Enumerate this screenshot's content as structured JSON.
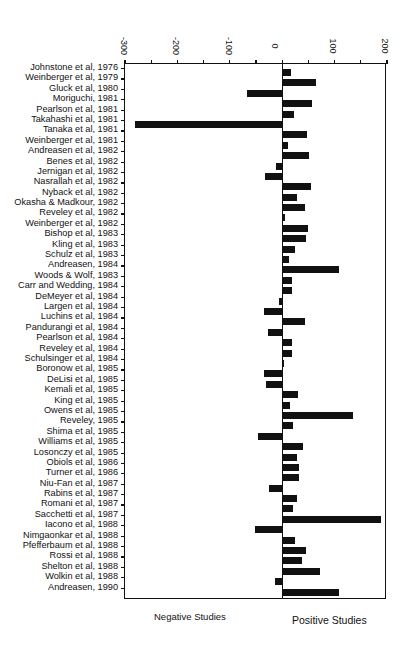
{
  "chart_data": {
    "type": "bar",
    "orientation": "horizontal",
    "title": "",
    "xlabel": "",
    "ylabel": "",
    "xlim": [
      -300,
      200
    ],
    "x_ticks": [
      -300,
      -200,
      -100,
      0,
      100,
      200
    ],
    "grid": false,
    "legend": null,
    "annotations": [
      "Negative Studies",
      "Positive Studies"
    ],
    "categories": [
      "Johnstone et al, 1976",
      "Weinberger et al, 1979",
      "Gluck et al, 1980",
      "Moriguchi, 1981",
      "Pearlson et al, 1981",
      "Takahashi et al, 1981",
      "Tanaka et al, 1981",
      "Weinberger et al, 1981",
      "Andreasen et al, 1982",
      "Benes et al, 1982",
      "Jernigan et al, 1982",
      "Nasrallah et al, 1982",
      "Nyback et al, 1982",
      "Okasha & Madkour, 1982",
      "Reveley et al, 1982",
      "Weinberger et al, 1982",
      "Bishop et al, 1983",
      "Kling et al, 1983",
      "Schulz et al, 1983",
      "Andreasen, 1984",
      "Woods & Wolf, 1983",
      "Carr and Wedding, 1984",
      "DeMeyer et al, 1984",
      "Largen et al, 1984",
      "Luchins et al, 1984",
      "Pandurangi et al, 1984",
      "Pearlson et al, 1984",
      "Reveley et al, 1984",
      "Schulsinger et al, 1984",
      "Boronow et al, 1985",
      "DeLisi et al, 1985",
      "Kemali et al, 1985",
      "King et al, 1985",
      "Owens et al, 1985",
      "Reveley, 1985",
      "Shima et al, 1985",
      "Williams et al, 1985",
      "Losonczy et al, 1985",
      "Obiols et al, 1986",
      "Turner et al, 1986",
      "Niu-Fan et al, 1987",
      "Rabins et al, 1987",
      "Romani et al, 1987",
      "Sacchetti et al, 1987",
      "Iacono et al, 1988",
      "Nimgaonkar et al, 1988",
      "Pfefferbaum et al, 1988",
      "Rossi et al, 1988",
      "Shelton et al, 1988",
      "Wolkin et al, 1988",
      "Andreasen, 1990"
    ],
    "values": [
      17,
      64,
      -68,
      57,
      22,
      -280,
      48,
      11,
      52,
      -11,
      -32,
      55,
      28,
      43,
      6,
      50,
      46,
      25,
      13,
      108,
      18,
      19,
      -7,
      -34,
      43,
      -27,
      18,
      19,
      4,
      -34,
      -31,
      30,
      15,
      136,
      20,
      -47,
      39,
      29,
      33,
      32,
      -25,
      29,
      20,
      189,
      -51,
      24,
      45,
      37,
      72,
      -14,
      109
    ]
  },
  "footer": {
    "negative_label": "Negative Studies",
    "positive_label": "Positive Studies"
  }
}
